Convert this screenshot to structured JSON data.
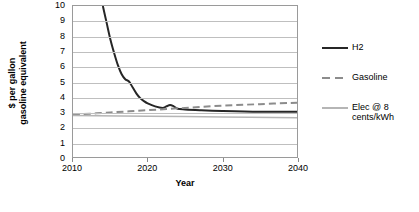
{
  "chart_data": {
    "type": "line",
    "title": "",
    "xlabel": "Year",
    "ylabel": "$ per gallon\ngasoline equivalent",
    "ylabel_line1": "$ per gallon",
    "ylabel_line2": "gasoline equivalent",
    "xlim": [
      2010,
      2040
    ],
    "ylim": [
      0,
      10
    ],
    "ytick_step": 1,
    "grid": true,
    "grid_axis": "y",
    "legend_position": "right",
    "xticks": [
      2010,
      2020,
      2030,
      2040
    ],
    "xtick_labels": [
      "2010",
      "2020",
      "2030",
      "2040"
    ],
    "yticks": [
      0,
      1,
      2,
      3,
      4,
      5,
      6,
      7,
      8,
      9,
      10
    ],
    "ytick_labels": [
      "0",
      "1",
      "2",
      "3",
      "4",
      "5",
      "6",
      "7",
      "8",
      "9",
      "10"
    ],
    "series": [
      {
        "name": "H2",
        "style": "solid",
        "color": "#262626",
        "width": 2.0,
        "x": [
          2014.0,
          2014.5,
          2015.0,
          2015.5,
          2016.0,
          2016.5,
          2017.0,
          2017.5,
          2018.0,
          2018.5,
          2019.0,
          2019.5,
          2020.0,
          2021.0,
          2022.0,
          2022.5,
          2023.0,
          2023.5,
          2024.0,
          2025.0,
          2027.0,
          2030.0,
          2035.0,
          2040.0
        ],
        "y": [
          10.0,
          8.9,
          7.8,
          6.9,
          6.1,
          5.5,
          5.15,
          5.0,
          4.6,
          4.2,
          3.9,
          3.7,
          3.55,
          3.35,
          3.25,
          3.35,
          3.45,
          3.35,
          3.2,
          3.15,
          3.1,
          3.05,
          3.0,
          3.0
        ]
      },
      {
        "name": "Gasoline",
        "style": "dashed",
        "color": "#8c8c8c",
        "width": 2.0,
        "x": [
          2010,
          2015,
          2020,
          2025,
          2030,
          2035,
          2040
        ],
        "y": [
          2.8,
          2.95,
          3.1,
          3.25,
          3.4,
          3.5,
          3.6
        ]
      },
      {
        "name": "Elec @ 8 cents/kWh",
        "style": "solid",
        "color": "#b5b5b5",
        "width": 1.5,
        "x": [
          2010,
          2020,
          2030,
          2040
        ],
        "y": [
          2.75,
          2.7,
          2.65,
          2.6
        ]
      }
    ]
  },
  "legend": {
    "entries": [
      {
        "label": "H2"
      },
      {
        "label": "Gasoline"
      },
      {
        "label": "Elec @ 8\ncents/kWh"
      }
    ]
  }
}
